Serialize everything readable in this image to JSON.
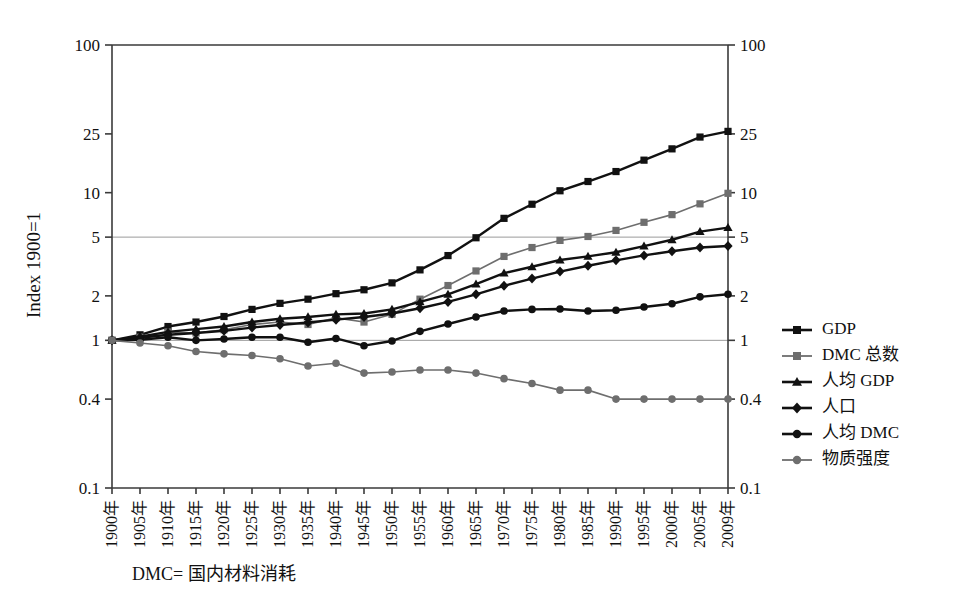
{
  "chart_data": {
    "type": "line",
    "title": "",
    "xlabel": "",
    "ylabel": "Index 1900=1",
    "y_scale": "log",
    "ylim": [
      0.1,
      100
    ],
    "y_ticks": [
      "100",
      "25",
      "10",
      "5",
      "2",
      "1",
      "0.4",
      "0.1"
    ],
    "y_tick_values": [
      100,
      25,
      10,
      5,
      2,
      1,
      0.4,
      0.1
    ],
    "gridlines": [
      5,
      1
    ],
    "grid": "horizontal-at-5-and-1",
    "legend_position": "right",
    "dual_y_axis": true,
    "categories": [
      "1900年",
      "1905年",
      "1910年",
      "1915年",
      "1920年",
      "1925年",
      "1930年",
      "1935年",
      "1940年",
      "1945年",
      "1950年",
      "1955年",
      "1960年",
      "1965年",
      "1970年",
      "1975年",
      "1980年",
      "1985年",
      "1990年",
      "1995年",
      "2000年",
      "2005年",
      "2009年"
    ],
    "x": [
      1900,
      1905,
      1910,
      1915,
      1920,
      1925,
      1930,
      1935,
      1940,
      1945,
      1950,
      1955,
      1960,
      1965,
      1970,
      1975,
      1980,
      1985,
      1990,
      1995,
      2000,
      2005,
      2009
    ],
    "series": [
      {
        "name": "GDP",
        "color": "#111111",
        "marker": "square",
        "values": [
          1.0,
          1.09,
          1.24,
          1.33,
          1.45,
          1.62,
          1.78,
          1.9,
          2.07,
          2.2,
          2.45,
          3.0,
          3.75,
          4.95,
          6.7,
          8.35,
          10.3,
          11.9,
          13.9,
          16.6,
          19.8,
          23.8,
          26.0
        ]
      },
      {
        "name": "DMC 总数",
        "color": "#6e6e6e",
        "marker": "square",
        "values": [
          1.0,
          1.05,
          1.14,
          1.12,
          1.18,
          1.28,
          1.33,
          1.28,
          1.42,
          1.33,
          1.5,
          1.9,
          2.35,
          2.95,
          3.7,
          4.25,
          4.75,
          5.05,
          5.55,
          6.3,
          7.1,
          8.4,
          9.9
        ]
      },
      {
        "name": "人均 GDP",
        "color": "#111111",
        "marker": "triangle",
        "values": [
          1.0,
          1.06,
          1.14,
          1.19,
          1.24,
          1.33,
          1.4,
          1.44,
          1.5,
          1.52,
          1.62,
          1.82,
          2.05,
          2.4,
          2.85,
          3.15,
          3.5,
          3.7,
          3.95,
          4.35,
          4.8,
          5.45,
          5.8
        ]
      },
      {
        "name": "人口",
        "color": "#111111",
        "marker": "diamond",
        "values": [
          1.0,
          1.04,
          1.09,
          1.12,
          1.16,
          1.22,
          1.27,
          1.32,
          1.38,
          1.44,
          1.52,
          1.65,
          1.82,
          2.05,
          2.34,
          2.62,
          2.92,
          3.2,
          3.48,
          3.76,
          4.01,
          4.25,
          4.35
        ]
      },
      {
        "name": "人均 DMC",
        "color": "#111111",
        "marker": "circle",
        "values": [
          1.0,
          1.01,
          1.05,
          1.0,
          1.02,
          1.05,
          1.05,
          0.97,
          1.03,
          0.92,
          0.99,
          1.15,
          1.29,
          1.44,
          1.58,
          1.62,
          1.63,
          1.58,
          1.6,
          1.68,
          1.77,
          1.97,
          2.05
        ]
      },
      {
        "name": "物质强度",
        "color": "#6e6e6e",
        "marker": "circle",
        "values": [
          1.0,
          0.96,
          0.92,
          0.84,
          0.81,
          0.79,
          0.75,
          0.67,
          0.7,
          0.6,
          0.61,
          0.63,
          0.63,
          0.6,
          0.55,
          0.51,
          0.46,
          0.46,
          0.4,
          0.4,
          0.4,
          0.4,
          0.4
        ]
      }
    ]
  },
  "legend": {
    "items": [
      {
        "label": "GDP"
      },
      {
        "label": "DMC 总数"
      },
      {
        "label": "人均 GDP"
      },
      {
        "label": "人口"
      },
      {
        "label": "人均 DMC"
      },
      {
        "label": "物质强度"
      }
    ]
  },
  "footnote": {
    "text": "DMC= 国内材料消耗"
  },
  "colors": {
    "black": "#111111",
    "gray": "#6e6e6e",
    "axis": "#3a3a3a",
    "grid": "#9a9a9a"
  }
}
